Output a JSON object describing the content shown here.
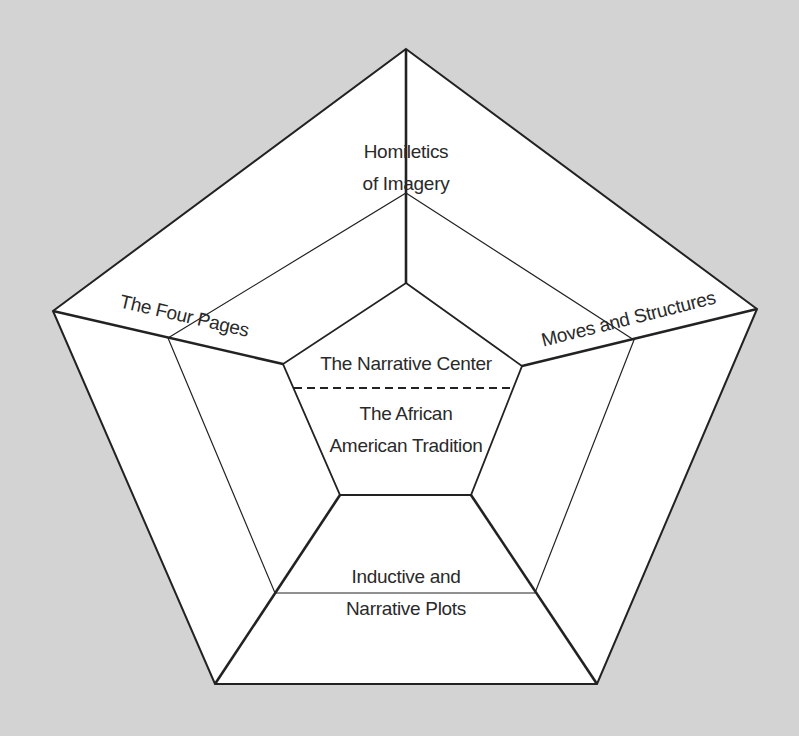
{
  "diagram": {
    "type": "nested pentagon diagram",
    "background": "#d3d3d3",
    "fill": "#ffffff",
    "stroke": "#222222",
    "segments": {
      "top": {
        "line1": "Homiletics",
        "line2": "of Imagery"
      },
      "left": {
        "label": "The Four Pages"
      },
      "right": {
        "label": "Moves and Structures"
      },
      "center": {
        "upper": "The Narrative Center",
        "lower_line1": "The African",
        "lower_line2": "American Tradition"
      },
      "bottom": {
        "line1": "Inductive and",
        "line2": "Narrative Plots"
      }
    }
  }
}
